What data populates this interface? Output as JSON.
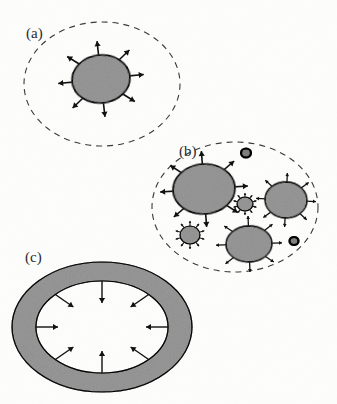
{
  "figure": {
    "width": 337,
    "height": 404,
    "background_color": "#fdfdfc",
    "caption_font_style": "serif"
  },
  "palette": {
    "fill_gray": "#c3c3c3",
    "fill_gray_dark": "#b4b4b4",
    "outline": "#1a1a1a",
    "dashed_boundary": "#3a3a3a",
    "arrow": "#111111",
    "label_color": "#2b2b2b",
    "page_background": "#fdfdfc"
  },
  "panels": [
    {
      "id": "a",
      "label": "(a)",
      "label_x": 26,
      "label_y": 38,
      "description": "single expanding body inside dashed boundary",
      "boundary": {
        "type": "dashed-ellipse",
        "cx": 102,
        "cy": 84,
        "rx": 78,
        "ry": 62,
        "dash": "6 5",
        "stroke_width": 1.1
      },
      "bodies": [
        {
          "name": "expanding-body",
          "cx": 101,
          "cy": 79,
          "rx": 29,
          "ry": 24,
          "rotation": -6,
          "arrows": 8,
          "arrow_direction": "outward",
          "arrow_length": 14,
          "arrow_head": 5,
          "stroke_width": 1.6
        }
      ]
    },
    {
      "id": "b",
      "label": "(b)",
      "label_x": 179,
      "label_y": 156,
      "description": "many bodies of differing sizes inside dashed boundary",
      "boundary": {
        "type": "dashed-ellipse",
        "cx": 235,
        "cy": 207,
        "rx": 83,
        "ry": 65,
        "dash": "6 5",
        "stroke_width": 1.1
      },
      "bodies": [
        {
          "name": "body-large",
          "cx": 204,
          "cy": 189,
          "rx": 31,
          "ry": 25,
          "rotation": -4,
          "arrows": 8,
          "arrow_direction": "outward",
          "arrow_length": 13,
          "arrow_head": 5,
          "stroke_width": 1.6
        },
        {
          "name": "body-medium-right",
          "cx": 286,
          "cy": 200,
          "rx": 21,
          "ry": 18,
          "rotation": 3,
          "arrows": 8,
          "arrow_direction": "outward",
          "arrow_length": 9,
          "arrow_head": 3,
          "stroke_width": 1.3
        },
        {
          "name": "body-medium-bottom",
          "cx": 249,
          "cy": 244,
          "rx": 23,
          "ry": 18,
          "rotation": -2,
          "arrows": 8,
          "arrow_direction": "outward",
          "arrow_length": 10,
          "arrow_head": 3,
          "stroke_width": 1.3
        },
        {
          "name": "body-small-left",
          "cx": 190,
          "cy": 235,
          "rx": 10,
          "ry": 9,
          "rotation": 0,
          "arrows": 10,
          "arrow_direction": "outward",
          "arrow_length": 5,
          "arrow_head": 2,
          "stroke_width": 1.1
        },
        {
          "name": "body-small-middle",
          "cx": 245,
          "cy": 204,
          "rx": 8,
          "ry": 7,
          "rotation": 0,
          "arrows": 10,
          "arrow_direction": "outward",
          "arrow_length": 4,
          "arrow_head": 2,
          "stroke_width": 1.1
        },
        {
          "name": "body-dot-top",
          "cx": 246,
          "cy": 153,
          "rx": 5,
          "ry": 4.5,
          "rotation": 0,
          "arrows": 0,
          "arrow_direction": "none",
          "arrow_length": 0,
          "arrow_head": 0,
          "stroke_width": 2.2
        },
        {
          "name": "body-dot-right",
          "cx": 294,
          "cy": 241,
          "rx": 4.5,
          "ry": 4,
          "rotation": 0,
          "arrows": 0,
          "arrow_direction": "none",
          "arrow_length": 0,
          "arrow_head": 0,
          "stroke_width": 2.2
        }
      ]
    },
    {
      "id": "c",
      "label": "(c)",
      "label_x": 25,
      "label_y": 262,
      "description": "contracting annular shell with inward arrows",
      "annulus": {
        "cx": 102,
        "cy": 327,
        "outer_rx": 90,
        "outer_ry": 65,
        "inner_rx": 66,
        "inner_ry": 46,
        "stroke_width": 1.2,
        "arrows": 8,
        "arrow_direction": "inward",
        "arrow_length": 22,
        "arrow_head": 5
      }
    }
  ]
}
